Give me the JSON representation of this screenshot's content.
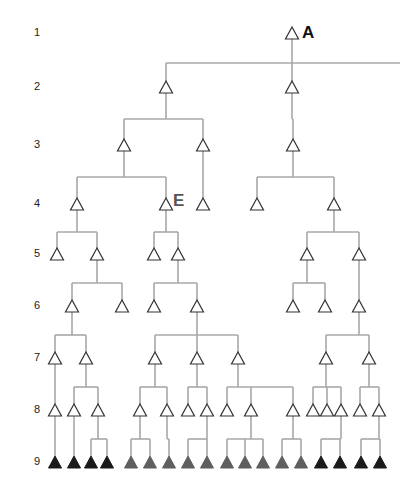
{
  "colors": {
    "edge": "#a8a8a8",
    "open_stroke": "#333333",
    "black": "#1a1a1a",
    "gray": "#5f5f5f",
    "tag_A": "#111111",
    "tag_E": "#555555"
  },
  "levels": [
    {
      "label": "1",
      "y": 33
    },
    {
      "label": "2",
      "y": 87
    },
    {
      "label": "3",
      "y": 145
    },
    {
      "label": "4",
      "y": 204
    },
    {
      "label": "5",
      "y": 254
    },
    {
      "label": "6",
      "y": 306
    },
    {
      "label": "7",
      "y": 358
    },
    {
      "label": "8",
      "y": 410
    },
    {
      "label": "9",
      "y": 462
    }
  ],
  "tags": [
    {
      "text": "A",
      "x": 302,
      "y": 24,
      "color_key": "tag_A"
    },
    {
      "text": "E",
      "x": 173,
      "y": 192,
      "color_key": "tag_E"
    }
  ],
  "nodes": [
    {
      "id": "A",
      "level": 1,
      "x": 292,
      "fill": "open"
    },
    {
      "id": "L2a",
      "level": 2,
      "x": 166,
      "fill": "open"
    },
    {
      "id": "L2b",
      "level": 2,
      "x": 292,
      "fill": "open"
    },
    {
      "id": "L3a",
      "level": 3,
      "x": 124,
      "fill": "open"
    },
    {
      "id": "L3b",
      "level": 3,
      "x": 203,
      "fill": "open"
    },
    {
      "id": "L3c",
      "level": 3,
      "x": 293,
      "fill": "open"
    },
    {
      "id": "L4a",
      "level": 4,
      "x": 77,
      "fill": "open"
    },
    {
      "id": "E",
      "level": 4,
      "x": 166,
      "fill": "open"
    },
    {
      "id": "L4c",
      "level": 4,
      "x": 203,
      "fill": "open"
    },
    {
      "id": "L4d",
      "level": 4,
      "x": 257,
      "fill": "open"
    },
    {
      "id": "L4e",
      "level": 4,
      "x": 334,
      "fill": "open"
    },
    {
      "id": "L5a",
      "level": 5,
      "x": 57,
      "fill": "open"
    },
    {
      "id": "L5b",
      "level": 5,
      "x": 97,
      "fill": "open"
    },
    {
      "id": "L5c",
      "level": 5,
      "x": 154,
      "fill": "open"
    },
    {
      "id": "L5d",
      "level": 5,
      "x": 178,
      "fill": "open"
    },
    {
      "id": "L5e",
      "level": 5,
      "x": 307,
      "fill": "open"
    },
    {
      "id": "L5f",
      "level": 5,
      "x": 359,
      "fill": "open"
    },
    {
      "id": "L6a",
      "level": 6,
      "x": 72,
      "fill": "open"
    },
    {
      "id": "L6b",
      "level": 6,
      "x": 122,
      "fill": "open"
    },
    {
      "id": "L6c",
      "level": 6,
      "x": 154,
      "fill": "open"
    },
    {
      "id": "L6d",
      "level": 6,
      "x": 197,
      "fill": "open"
    },
    {
      "id": "L6e",
      "level": 6,
      "x": 293,
      "fill": "open"
    },
    {
      "id": "L6f",
      "level": 6,
      "x": 325,
      "fill": "open"
    },
    {
      "id": "L6g",
      "level": 6,
      "x": 359,
      "fill": "open"
    },
    {
      "id": "L7a",
      "level": 7,
      "x": 55,
      "fill": "open"
    },
    {
      "id": "L7b",
      "level": 7,
      "x": 86,
      "fill": "open"
    },
    {
      "id": "L7c",
      "level": 7,
      "x": 155,
      "fill": "open"
    },
    {
      "id": "L7d",
      "level": 7,
      "x": 197,
      "fill": "open"
    },
    {
      "id": "L7e",
      "level": 7,
      "x": 238,
      "fill": "open"
    },
    {
      "id": "L7f",
      "level": 7,
      "x": 326,
      "fill": "open"
    },
    {
      "id": "L7g",
      "level": 7,
      "x": 369,
      "fill": "open"
    },
    {
      "id": "L8a",
      "level": 8,
      "x": 55,
      "fill": "open"
    },
    {
      "id": "L8b",
      "level": 8,
      "x": 74,
      "fill": "open"
    },
    {
      "id": "L8c",
      "level": 8,
      "x": 98,
      "fill": "open"
    },
    {
      "id": "L8d",
      "level": 8,
      "x": 140,
      "fill": "open"
    },
    {
      "id": "L8e",
      "level": 8,
      "x": 167,
      "fill": "open"
    },
    {
      "id": "L8f",
      "level": 8,
      "x": 188,
      "fill": "open"
    },
    {
      "id": "L8g",
      "level": 8,
      "x": 207,
      "fill": "open"
    },
    {
      "id": "L8h",
      "level": 8,
      "x": 227,
      "fill": "open"
    },
    {
      "id": "L8i",
      "level": 8,
      "x": 251,
      "fill": "open"
    },
    {
      "id": "L8j",
      "level": 8,
      "x": 293,
      "fill": "open"
    },
    {
      "id": "L8k",
      "level": 8,
      "x": 313,
      "fill": "open"
    },
    {
      "id": "L8l",
      "level": 8,
      "x": 327,
      "fill": "open"
    },
    {
      "id": "L8m",
      "level": 8,
      "x": 341,
      "fill": "open"
    },
    {
      "id": "L8n",
      "level": 8,
      "x": 360,
      "fill": "open"
    },
    {
      "id": "L8o",
      "level": 8,
      "x": 379,
      "fill": "open"
    },
    {
      "id": "B1",
      "level": 9,
      "x": 55,
      "fill": "black"
    },
    {
      "id": "B2",
      "level": 9,
      "x": 74,
      "fill": "black"
    },
    {
      "id": "B3",
      "level": 9,
      "x": 91,
      "fill": "black"
    },
    {
      "id": "B4",
      "level": 9,
      "x": 107,
      "fill": "black"
    },
    {
      "id": "G1",
      "level": 9,
      "x": 131,
      "fill": "gray"
    },
    {
      "id": "G2",
      "level": 9,
      "x": 150,
      "fill": "gray"
    },
    {
      "id": "G3",
      "level": 9,
      "x": 169,
      "fill": "gray"
    },
    {
      "id": "G4",
      "level": 9,
      "x": 188,
      "fill": "gray"
    },
    {
      "id": "G5",
      "level": 9,
      "x": 207,
      "fill": "gray"
    },
    {
      "id": "G6",
      "level": 9,
      "x": 227,
      "fill": "gray"
    },
    {
      "id": "G7",
      "level": 9,
      "x": 245,
      "fill": "gray"
    },
    {
      "id": "G8",
      "level": 9,
      "x": 263,
      "fill": "gray"
    },
    {
      "id": "G9",
      "level": 9,
      "x": 282,
      "fill": "gray"
    },
    {
      "id": "G10",
      "level": 9,
      "x": 301,
      "fill": "gray"
    },
    {
      "id": "B5",
      "level": 9,
      "x": 321,
      "fill": "black"
    },
    {
      "id": "B6",
      "level": 9,
      "x": 340,
      "fill": "black"
    },
    {
      "id": "B7",
      "level": 9,
      "x": 361,
      "fill": "black"
    },
    {
      "id": "B8",
      "level": 9,
      "x": 380,
      "fill": "black"
    }
  ],
  "edges": [
    {
      "parent": "A",
      "children": [
        "L2a",
        "L2b"
      ],
      "bar_extends_to": 400
    },
    {
      "parent": "L2a",
      "children": [
        "L3a",
        "L3b"
      ]
    },
    {
      "parent": "L2b",
      "children": [
        "L3c"
      ]
    },
    {
      "parent": "L3a",
      "children": [
        "L4a",
        "E"
      ]
    },
    {
      "parent": "L3b",
      "children": [
        "L4c"
      ]
    },
    {
      "parent": "L3c",
      "children": [
        "L4d",
        "L4e"
      ]
    },
    {
      "parent": "L4a",
      "children": [
        "L5a",
        "L5b"
      ]
    },
    {
      "parent": "E",
      "children": [
        "L5c",
        "L5d"
      ]
    },
    {
      "parent": "L4e",
      "children": [
        "L5e",
        "L5f"
      ]
    },
    {
      "parent": "L5b",
      "children": [
        "L6a",
        "L6b"
      ]
    },
    {
      "parent": "L5d",
      "children": [
        "L6c",
        "L6d"
      ]
    },
    {
      "parent": "L5e",
      "children": [
        "L6e",
        "L6f"
      ]
    },
    {
      "parent": "L5f",
      "children": [
        "L6g"
      ]
    },
    {
      "parent": "L6a",
      "children": [
        "L7a",
        "L7b"
      ]
    },
    {
      "parent": "L6d",
      "children": [
        "L7c",
        "L7d",
        "L7e"
      ]
    },
    {
      "parent": "L6g",
      "children": [
        "L7f",
        "L7g"
      ]
    },
    {
      "parent": "L7a",
      "children": [
        "L8a"
      ]
    },
    {
      "parent": "L7b",
      "children": [
        "L8b",
        "L8c"
      ]
    },
    {
      "parent": "L7c",
      "children": [
        "L8d",
        "L8e"
      ]
    },
    {
      "parent": "L7d",
      "children": [
        "L8f",
        "L8g"
      ]
    },
    {
      "parent": "L7e",
      "children": [
        "L8h",
        "L8i",
        "L8j"
      ]
    },
    {
      "parent": "L7f",
      "children": [
        "L8k",
        "L8l",
        "L8m"
      ]
    },
    {
      "parent": "L7g",
      "children": [
        "L8n",
        "L8o"
      ]
    },
    {
      "parent": "L8a",
      "children": [
        "B1"
      ]
    },
    {
      "parent": "L8b",
      "children": [
        "B2"
      ]
    },
    {
      "parent": "L8c",
      "children": [
        "B3",
        "B4"
      ]
    },
    {
      "parent": "L8d",
      "children": [
        "G1",
        "G2"
      ]
    },
    {
      "parent": "L8e",
      "children": [
        "G3"
      ]
    },
    {
      "parent": "L8g",
      "children": [
        "G4",
        "G5"
      ]
    },
    {
      "parent": "L8i",
      "children": [
        "G6",
        "G7",
        "G8"
      ]
    },
    {
      "parent": "L8j",
      "children": [
        "G9",
        "G10"
      ]
    },
    {
      "parent": "L8m",
      "children": [
        "B5",
        "B6"
      ]
    },
    {
      "parent": "L8o",
      "children": [
        "B7",
        "B8"
      ]
    }
  ]
}
